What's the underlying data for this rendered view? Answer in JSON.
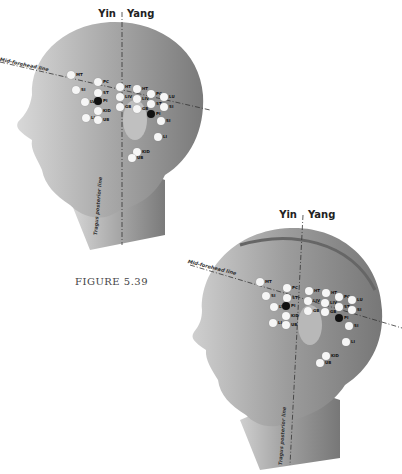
{
  "caption": "FIGURE 5.39",
  "figures": [
    {
      "id": "head-skin",
      "yin_label": "Yin",
      "yang_label": "Yang",
      "mid_forehead_label": "Mid-forehead line",
      "tragus_line_label": "Tragus posterior line",
      "points": [
        {
          "label": "MT",
          "x": 71,
          "y": 75,
          "dark": false
        },
        {
          "label": "SI",
          "x": 76,
          "y": 90,
          "dark": false
        },
        {
          "label": "PC",
          "x": 98,
          "y": 82,
          "dark": false
        },
        {
          "label": "ST",
          "x": 98,
          "y": 93,
          "dark": false
        },
        {
          "label": "LV",
          "x": 85,
          "y": 102,
          "dark": false
        },
        {
          "label": "PI",
          "x": 98,
          "y": 101,
          "dark": true
        },
        {
          "label": "KID",
          "x": 98,
          "y": 111,
          "dark": false
        },
        {
          "label": "LI",
          "x": 86,
          "y": 118,
          "dark": false
        },
        {
          "label": "UB",
          "x": 98,
          "y": 120,
          "dark": false
        },
        {
          "label": "HT",
          "x": 120,
          "y": 87,
          "dark": false
        },
        {
          "label": "LIV",
          "x": 120,
          "y": 97,
          "dark": false
        },
        {
          "label": "GB",
          "x": 120,
          "y": 107,
          "dark": false
        },
        {
          "label": "HT",
          "x": 137,
          "y": 89,
          "dark": false
        },
        {
          "label": "LIV",
          "x": 137,
          "y": 99,
          "dark": false
        },
        {
          "label": "GB",
          "x": 137,
          "y": 109,
          "dark": false
        },
        {
          "label": "PC",
          "x": 151,
          "y": 94,
          "dark": false
        },
        {
          "label": "ST",
          "x": 151,
          "y": 104,
          "dark": false
        },
        {
          "label": "PI",
          "x": 151,
          "y": 114,
          "dark": true
        },
        {
          "label": "LU",
          "x": 164,
          "y": 97,
          "dark": false
        },
        {
          "label": "SI",
          "x": 164,
          "y": 107,
          "dark": false
        },
        {
          "label": "SI",
          "x": 161,
          "y": 121,
          "dark": false
        },
        {
          "label": "LI",
          "x": 158,
          "y": 137,
          "dark": false
        },
        {
          "label": "KID",
          "x": 137,
          "y": 152,
          "dark": false
        },
        {
          "label": "UB",
          "x": 132,
          "y": 158,
          "dark": false
        }
      ]
    },
    {
      "id": "head-muscle",
      "yin_label": "Yin",
      "yang_label": "Yang",
      "mid_forehead_label": "Mid-forehead line",
      "tragus_line_label": "Tragus posterior line",
      "points": [
        {
          "label": "MT",
          "x": 260,
          "y": 282,
          "dark": false
        },
        {
          "label": "SI",
          "x": 266,
          "y": 296,
          "dark": false
        },
        {
          "label": "PC",
          "x": 287,
          "y": 288,
          "dark": false
        },
        {
          "label": "ST",
          "x": 287,
          "y": 298,
          "dark": false
        },
        {
          "label": "LV",
          "x": 274,
          "y": 307,
          "dark": false
        },
        {
          "label": "PI",
          "x": 286,
          "y": 306,
          "dark": true
        },
        {
          "label": "KID",
          "x": 286,
          "y": 316,
          "dark": false
        },
        {
          "label": "LI",
          "x": 273,
          "y": 323,
          "dark": false
        },
        {
          "label": "UB",
          "x": 286,
          "y": 325,
          "dark": false
        },
        {
          "label": "HT",
          "x": 309,
          "y": 291,
          "dark": false
        },
        {
          "label": "LIV",
          "x": 308,
          "y": 301,
          "dark": false
        },
        {
          "label": "GB",
          "x": 308,
          "y": 311,
          "dark": false
        },
        {
          "label": "HT",
          "x": 326,
          "y": 293,
          "dark": false
        },
        {
          "label": "LIV",
          "x": 325,
          "y": 303,
          "dark": false
        },
        {
          "label": "GB",
          "x": 325,
          "y": 312,
          "dark": false
        },
        {
          "label": "PC",
          "x": 339,
          "y": 297,
          "dark": false
        },
        {
          "label": "ST",
          "x": 339,
          "y": 307,
          "dark": false
        },
        {
          "label": "PI",
          "x": 339,
          "y": 318,
          "dark": true
        },
        {
          "label": "LU",
          "x": 352,
          "y": 300,
          "dark": false
        },
        {
          "label": "SI",
          "x": 352,
          "y": 310,
          "dark": false
        },
        {
          "label": "SI",
          "x": 349,
          "y": 326,
          "dark": false
        },
        {
          "label": "LI",
          "x": 346,
          "y": 342,
          "dark": false
        },
        {
          "label": "KID",
          "x": 326,
          "y": 356,
          "dark": false
        },
        {
          "label": "UB",
          "x": 320,
          "y": 363,
          "dark": false
        }
      ]
    }
  ]
}
